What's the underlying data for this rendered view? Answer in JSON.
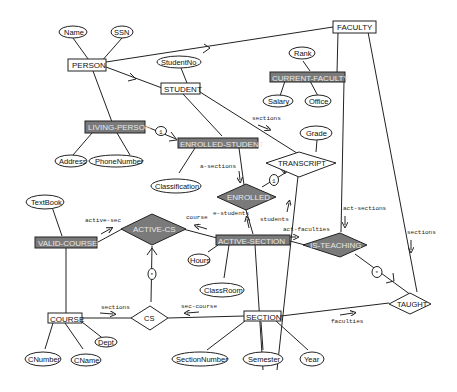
{
  "diagram": {
    "type": "entity-relationship",
    "entities": {
      "person": "PERSON",
      "faculty": "FACULTY",
      "student": "STUDENT",
      "current_faculty": "CURRENT-FACULTY",
      "living_person": "LIVING-PERSON",
      "enrolled_student": "ENROLLED-STUDENT",
      "valid_course": "VALID-COURSE",
      "active_section": "ACTIVE-SECTION",
      "course": "COURSE",
      "section": "SECTION"
    },
    "relationships": {
      "transcript": "TRANSCRIPT",
      "enrolled": "ENROLLED",
      "active_cs": "ACTIVE-CS",
      "is_teaching": "IS-TEACHING",
      "cs": "CS",
      "taught": "TAUGHT"
    },
    "attributes": {
      "name": "Name",
      "ssn": "SSN",
      "student_no": "StudentNo",
      "rank": "Rank",
      "salary": "Salary",
      "office": "Office",
      "grade": "Grade",
      "address": "Address",
      "phone_number": "PhoneNumber",
      "classification": "Classification",
      "textbook": "TextBook",
      "hours": "Hours",
      "classroom": "ClassRoom",
      "dept": "Dept",
      "cnumber": "CNumber",
      "cname": "CName",
      "section_number": "SectionNumber",
      "semester": "Semester",
      "year": "Year"
    },
    "roles": {
      "sections_student": "sections",
      "a_sections": "a-sections",
      "e_students": "e-students",
      "students": "students",
      "course": "course",
      "active_sec": "active-sec",
      "act_faculties": "act-faculties",
      "act_sections": "act-sections",
      "sections_faculty": "sections",
      "sections_course": "sections",
      "sec_course": "sec-course",
      "faculties": "faculties"
    },
    "markers": {
      "one": "1",
      "star": "*"
    },
    "colors": {
      "line": "#222222",
      "shaded_fill": "#7a7a7a",
      "shaded_text": "#e8e8e8",
      "plain_fill": "#ffffff"
    }
  }
}
